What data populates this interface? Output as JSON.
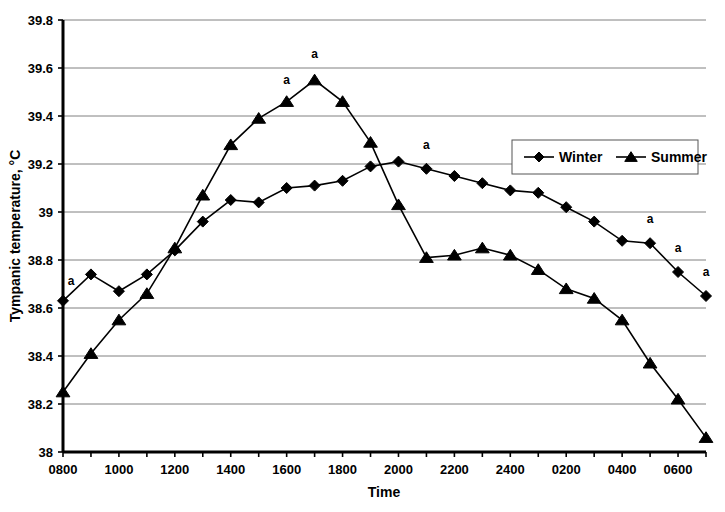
{
  "chart_data": {
    "type": "line",
    "title": "",
    "xlabel": "Time",
    "ylabel": "Tympanic temperature, °C",
    "x": [
      "0800",
      "0900",
      "1000",
      "1100",
      "1200",
      "1300",
      "1400",
      "1500",
      "1600",
      "1700",
      "1800",
      "1900",
      "2000",
      "2100",
      "2200",
      "2300",
      "2400",
      "0100",
      "0200",
      "0300",
      "0400",
      "0500",
      "0600",
      "0700"
    ],
    "xtick_labels": [
      "0800",
      "",
      "1000",
      "",
      "1200",
      "",
      "1400",
      "",
      "1600",
      "",
      "1800",
      "",
      "2000",
      "",
      "2200",
      "",
      "2400",
      "",
      "0200",
      "",
      "0400",
      "",
      "0600",
      ""
    ],
    "ylim": [
      38,
      39.8
    ],
    "ytick_labels": [
      "38",
      "38.2",
      "38.4",
      "38.6",
      "38.8",
      "39",
      "39.2",
      "39.4",
      "39.6",
      "39.8"
    ],
    "ytick_values": [
      38,
      38.2,
      38.4,
      38.6,
      38.8,
      39,
      39.2,
      39.4,
      39.6,
      39.8
    ],
    "grid": true,
    "grid_axis": "y",
    "legend_position": "upper right",
    "series": [
      {
        "name": "Winter",
        "marker": "diamond",
        "color": "#000000",
        "values": [
          38.63,
          38.74,
          38.67,
          38.74,
          38.84,
          38.96,
          39.05,
          39.04,
          39.1,
          39.11,
          39.13,
          39.19,
          39.21,
          39.18,
          39.15,
          39.12,
          39.09,
          39.08,
          39.02,
          38.96,
          38.88,
          38.87,
          38.75,
          38.65
        ]
      },
      {
        "name": "Summer",
        "marker": "triangle",
        "color": "#000000",
        "values": [
          38.25,
          38.41,
          38.55,
          38.66,
          38.85,
          39.07,
          39.28,
          39.39,
          39.46,
          39.55,
          39.46,
          39.29,
          39.03,
          38.81,
          38.82,
          38.85,
          38.82,
          38.76,
          38.68,
          38.64,
          38.55,
          38.37,
          38.22,
          38.06
        ]
      }
    ],
    "annotations": [
      {
        "label": "a",
        "x": "0800",
        "series": "Winter",
        "value": 38.63,
        "dx": 8,
        "dy": -16
      },
      {
        "label": "a",
        "x": "1600",
        "series": "Summer",
        "value": 39.46,
        "dx": 0,
        "dy": -18
      },
      {
        "label": "a",
        "x": "1700",
        "series": "Summer",
        "value": 39.55,
        "dx": 0,
        "dy": -22
      },
      {
        "label": "a",
        "x": "2100",
        "series": "Winter",
        "value": 39.18,
        "dx": 0,
        "dy": -20
      },
      {
        "label": "a",
        "x": "0500",
        "series": "Winter",
        "value": 38.87,
        "dx": 0,
        "dy": -20
      },
      {
        "label": "a",
        "x": "0600",
        "series": "Winter",
        "value": 38.75,
        "dx": 0,
        "dy": -20
      },
      {
        "label": "a",
        "x": "0700",
        "series": "Winter",
        "value": 38.65,
        "dx": 0,
        "dy": -20
      }
    ]
  },
  "legend": {
    "items": [
      {
        "label": "Winter",
        "marker": "diamond"
      },
      {
        "label": "Summer",
        "marker": "triangle"
      }
    ]
  }
}
